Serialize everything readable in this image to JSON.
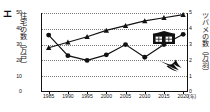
{
  "option_marker": "エ",
  "axis_titles": {
    "left": "住宅の数（万戸）",
    "right": "ツバメの数（万羽）",
    "x_unit": "(年)"
  },
  "legend": {
    "house_icon": "house-icon",
    "bird_icon": "swallow-icon"
  },
  "chart_data": {
    "type": "line",
    "title": "",
    "xlabel": "(年)",
    "ylabel": "住宅の数（万戸）",
    "y2label": "ツバメの数（万羽）",
    "grid": true,
    "legend_position": "inside-right",
    "categories": [
      "1985",
      "1990",
      "1995",
      "2000",
      "2005",
      "2010",
      "2015",
      "2020"
    ],
    "x": [
      1985,
      1990,
      1995,
      2000,
      2005,
      2010,
      2015,
      2020
    ],
    "xlim": [
      1983,
      2021
    ],
    "ylim": [
      0,
      50
    ],
    "y2lim": [
      0,
      5
    ],
    "yticks": [
      0,
      10,
      20,
      30,
      40,
      50
    ],
    "y2ticks": [
      0,
      1,
      2,
      3,
      4,
      5
    ],
    "series": [
      {
        "name": "住宅の数（万戸）",
        "axis": "left",
        "marker": "triangle",
        "values": [
          28,
          31.5,
          35,
          39,
          42,
          45,
          47,
          49
        ]
      },
      {
        "name": "ツバメの数（万羽）",
        "axis": "right",
        "marker": "circle",
        "values": [
          3.6,
          2.3,
          2.0,
          2.35,
          3.0,
          2.2,
          3.0,
          3.65
        ]
      }
    ]
  }
}
